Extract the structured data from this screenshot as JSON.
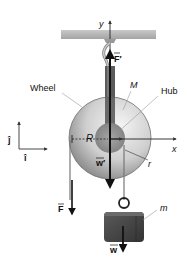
{
  "diagram": {
    "type": "pulley-free-body",
    "labels": {
      "wheel": "Wheel",
      "hub": "Hub",
      "wheel_mass": "M",
      "hanging_mass": "m",
      "radius_outer": "R",
      "radius_inner": "r",
      "axis_x": "x",
      "axis_y": "y",
      "unit_i": "î",
      "unit_j": "ĵ",
      "force_F": "F",
      "force_F_prime": "F′",
      "weight_wheel": "w′",
      "weight_mass": "w"
    },
    "colors": {
      "ceiling": "#b5b5b5",
      "wheel_light": "#e2e2e2",
      "wheel_dark": "#8a8a8a",
      "hub": "#8f8f8f",
      "block": "#4a4a4a",
      "rope": "#555555",
      "arrow": "#111111",
      "leader_line": "#999999"
    }
  }
}
